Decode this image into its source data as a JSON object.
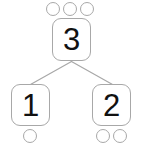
{
  "diagram": {
    "type": "number-bond",
    "colors": {
      "background": "#ffffff",
      "outline": "#a8a8a8",
      "connector": "#a8a8a8",
      "digit": "#111111"
    },
    "whole": {
      "value": "3",
      "counter_count": 3,
      "counters": [
        "circle",
        "circle",
        "circle"
      ]
    },
    "parts": [
      {
        "value": "1",
        "counter_count": 1,
        "counters": [
          "circle"
        ]
      },
      {
        "value": "2",
        "counter_count": 2,
        "counters": [
          "circle",
          "circle"
        ]
      }
    ],
    "connectors": [
      {
        "from": "whole",
        "to": "part-left"
      },
      {
        "from": "whole",
        "to": "part-right"
      }
    ]
  }
}
